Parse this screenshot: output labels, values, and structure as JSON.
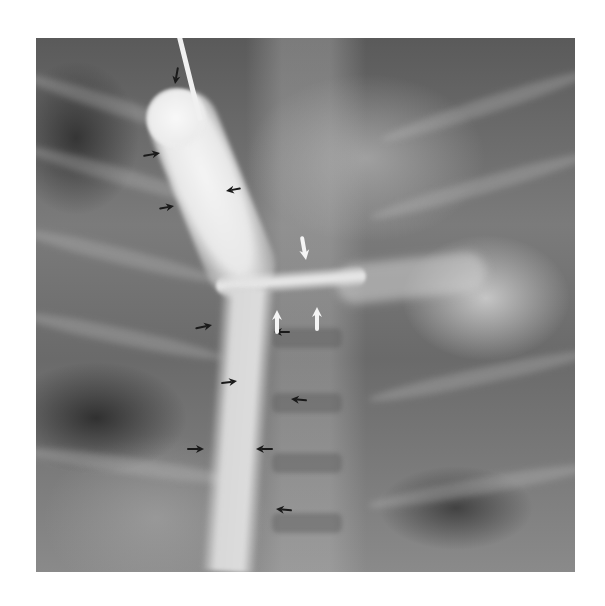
{
  "figure": {
    "type": "radiograph",
    "frame": {
      "left": 36,
      "top": 38,
      "width": 539,
      "height": 534
    },
    "colors": {
      "background": "#ffffff",
      "black_arrow": "#1a1a1a",
      "white_arrow": "#f5f5f5"
    }
  },
  "annotations": {
    "black_arrows": [
      {
        "id": "a1",
        "x": 175,
        "y": 84,
        "angle": 100,
        "size": 16
      },
      {
        "id": "a2",
        "x": 160,
        "y": 153,
        "angle": -10,
        "size": 16
      },
      {
        "id": "a3",
        "x": 226,
        "y": 191,
        "angle": 170,
        "size": 14
      },
      {
        "id": "a4",
        "x": 174,
        "y": 206,
        "angle": -10,
        "size": 14
      },
      {
        "id": "a5",
        "x": 212,
        "y": 325,
        "angle": -12,
        "size": 16
      },
      {
        "id": "a6",
        "x": 274,
        "y": 332,
        "angle": 180,
        "size": 15
      },
      {
        "id": "a7",
        "x": 237,
        "y": 381,
        "angle": -8,
        "size": 15
      },
      {
        "id": "a8",
        "x": 291,
        "y": 399,
        "angle": 185,
        "size": 15
      },
      {
        "id": "a9",
        "x": 204,
        "y": 449,
        "angle": 0,
        "size": 16
      },
      {
        "id": "a10",
        "x": 256,
        "y": 449,
        "angle": 180,
        "size": 16
      },
      {
        "id": "a11",
        "x": 276,
        "y": 509,
        "angle": 185,
        "size": 15
      }
    ],
    "white_arrows": [
      {
        "id": "w1",
        "x": 306,
        "y": 260,
        "angle": 80,
        "size": 22
      },
      {
        "id": "w2",
        "x": 277,
        "y": 310,
        "angle": -90,
        "size": 22
      },
      {
        "id": "w3",
        "x": 317,
        "y": 307,
        "angle": -90,
        "size": 22
      }
    ]
  }
}
